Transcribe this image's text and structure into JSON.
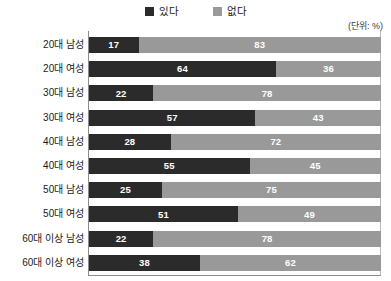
{
  "legend": {
    "entries": [
      {
        "label": "있다",
        "color": "#2b2b2b",
        "key": "yes"
      },
      {
        "label": "없다",
        "color": "#999999",
        "key": "no"
      }
    ]
  },
  "unit_note": "(단위: %)",
  "chart_data": {
    "type": "bar",
    "orientation": "horizontal",
    "stacked": true,
    "stack_total": 100,
    "title": "",
    "subtitle": "",
    "xlabel": "",
    "ylabel": "",
    "unit": "(단위: %)",
    "xlim": [
      0,
      100
    ],
    "grid": false,
    "legend_position": "top-center",
    "categories": [
      "20대 남성",
      "20대 여성",
      "30대 남성",
      "30대 여성",
      "40대 남성",
      "40대 여성",
      "50대 남성",
      "50대 여성",
      "60대 이상 남성",
      "60대 이상 여성"
    ],
    "series": [
      {
        "name": "있다",
        "color": "#2b2b2b",
        "values": [
          17,
          64,
          22,
          57,
          28,
          55,
          25,
          51,
          22,
          38
        ]
      },
      {
        "name": "없다",
        "color": "#999999",
        "values": [
          83,
          36,
          78,
          43,
          72,
          45,
          75,
          49,
          78,
          62
        ]
      }
    ],
    "rows": [
      {
        "category": "20대 남성",
        "yes": 17,
        "no": 83
      },
      {
        "category": "20대 여성",
        "yes": 64,
        "no": 36
      },
      {
        "category": "30대 남성",
        "yes": 22,
        "no": 78
      },
      {
        "category": "30대 여성",
        "yes": 57,
        "no": 43
      },
      {
        "category": "40대 남성",
        "yes": 28,
        "no": 72
      },
      {
        "category": "40대 여성",
        "yes": 55,
        "no": 45
      },
      {
        "category": "50대 남성",
        "yes": 25,
        "no": 75
      },
      {
        "category": "50대 여성",
        "yes": 51,
        "no": 49
      },
      {
        "category": "60대 이상 남성",
        "yes": 22,
        "no": 78
      },
      {
        "category": "60대 이상 여성",
        "yes": 38,
        "no": 62
      }
    ]
  }
}
